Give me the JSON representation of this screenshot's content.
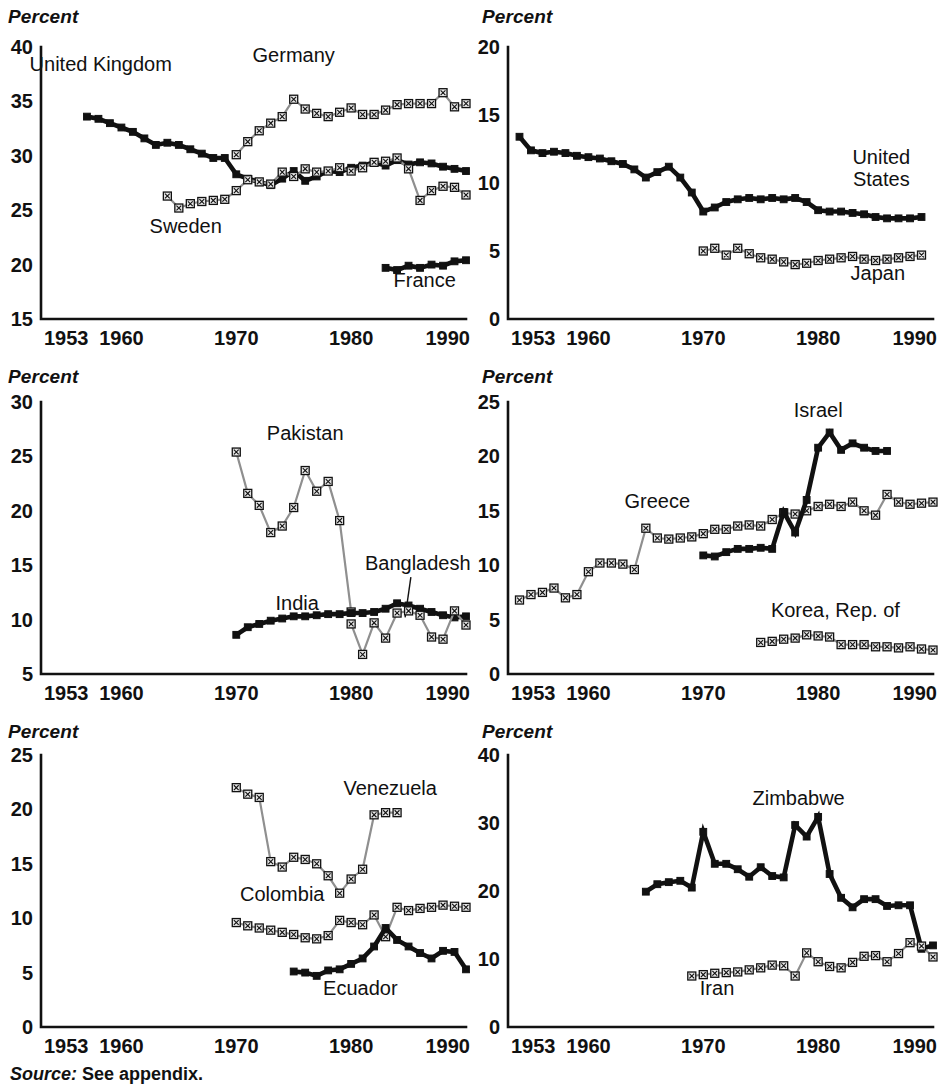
{
  "figure": {
    "source_label": "Source:",
    "source_text": "See appendix.",
    "axis_unit_label": "Percent"
  },
  "chart_data": [
    {
      "id": "panel-1",
      "type": "line",
      "title": "",
      "xlabel": "",
      "ylabel": "Percent",
      "xlim": [
        1953,
        1990
      ],
      "ylim": [
        15,
        40
      ],
      "xticks": [
        1953,
        1960,
        1970,
        1980,
        1990
      ],
      "yticks": [
        15,
        20,
        25,
        30,
        35,
        40
      ],
      "grid": false,
      "legend": "inline-annotations",
      "series": [
        {
          "name": "United Kingdom",
          "style": "dark-filled-square",
          "label_x": 1958.2,
          "label_y": 37.8,
          "x": [
            1957,
            1958,
            1959,
            1960,
            1961,
            1962,
            1963,
            1964,
            1965,
            1966,
            1967,
            1968,
            1969,
            1970,
            1971,
            1972,
            1973,
            1974,
            1975,
            1976,
            1977,
            1978,
            1979,
            1980,
            1981,
            1982,
            1983,
            1984,
            1985,
            1986,
            1987,
            1988,
            1989,
            1990
          ],
          "y": [
            33.6,
            33.4,
            33.0,
            32.6,
            32.2,
            31.6,
            31.0,
            31.2,
            31.0,
            30.6,
            30.2,
            29.8,
            29.8,
            28.3,
            27.9,
            27.6,
            27.3,
            27.9,
            28.6,
            27.7,
            28.1,
            28.6,
            28.5,
            28.9,
            29.1,
            29.4,
            29.1,
            29.6,
            29.2,
            29.4,
            29.3,
            29.0,
            28.8,
            28.6
          ]
        },
        {
          "name": "Germany",
          "style": "light-hatched-square",
          "label_x": 1975.0,
          "label_y": 38.6,
          "x": [
            1970,
            1971,
            1972,
            1973,
            1974,
            1975,
            1976,
            1977,
            1978,
            1979,
            1980,
            1981,
            1982,
            1983,
            1984,
            1985,
            1986,
            1987,
            1988,
            1989,
            1990
          ],
          "y": [
            30.1,
            31.3,
            32.3,
            33.0,
            33.6,
            35.2,
            34.3,
            33.9,
            33.6,
            34.0,
            34.4,
            33.8,
            33.8,
            34.2,
            34.7,
            34.8,
            34.8,
            34.8,
            35.8,
            34.5,
            34.8
          ]
        },
        {
          "name": "Sweden",
          "style": "light-hatched-square",
          "label_x": 1965.6,
          "label_y": 22.9,
          "x": [
            1964,
            1965,
            1966,
            1967,
            1968,
            1969,
            1970,
            1971,
            1972,
            1973,
            1974,
            1975,
            1976,
            1977,
            1978,
            1979,
            1980,
            1981,
            1982,
            1983,
            1984,
            1985,
            1986,
            1987,
            1988,
            1989,
            1990
          ],
          "y": [
            26.3,
            25.2,
            25.6,
            25.8,
            25.9,
            26.0,
            26.8,
            27.8,
            27.6,
            27.4,
            28.5,
            28.1,
            28.8,
            28.5,
            28.6,
            28.9,
            28.6,
            28.9,
            29.4,
            29.5,
            29.8,
            28.8,
            25.9,
            26.8,
            27.2,
            27.1,
            26.4
          ]
        },
        {
          "name": "France",
          "style": "dark-filled-square",
          "label_x": 1986.4,
          "label_y": 17.9,
          "x": [
            1983,
            1984,
            1985,
            1986,
            1987,
            1988,
            1989,
            1990
          ],
          "y": [
            19.7,
            19.5,
            19.9,
            19.7,
            20.0,
            19.9,
            20.3,
            20.4
          ]
        }
      ]
    },
    {
      "id": "panel-2",
      "type": "line",
      "title": "",
      "xlabel": "",
      "ylabel": "Percent",
      "xlim": [
        1953,
        1990
      ],
      "ylim": [
        0,
        20
      ],
      "xticks": [
        1953,
        1960,
        1970,
        1980,
        1990
      ],
      "yticks": [
        0,
        5,
        10,
        15,
        20
      ],
      "grid": false,
      "legend": "inline-annotations",
      "series": [
        {
          "name": "United States",
          "style": "dark-filled-square",
          "label_x": 1985.5,
          "label_y": 11.4,
          "label_lines": [
            "United",
            "States"
          ],
          "x": [
            1954,
            1955,
            1956,
            1957,
            1958,
            1959,
            1960,
            1961,
            1962,
            1963,
            1964,
            1965,
            1966,
            1967,
            1968,
            1969,
            1970,
            1971,
            1972,
            1973,
            1974,
            1975,
            1976,
            1977,
            1978,
            1979,
            1980,
            1981,
            1982,
            1983,
            1984,
            1985,
            1986,
            1987,
            1988,
            1989
          ],
          "y": [
            13.4,
            12.4,
            12.2,
            12.3,
            12.2,
            12.0,
            11.9,
            11.8,
            11.6,
            11.4,
            11.0,
            10.4,
            10.8,
            11.2,
            10.4,
            9.3,
            7.9,
            8.2,
            8.6,
            8.8,
            8.9,
            8.8,
            8.9,
            8.8,
            8.9,
            8.6,
            8.0,
            7.9,
            7.9,
            7.8,
            7.7,
            7.5,
            7.4,
            7.4,
            7.4,
            7.5
          ]
        },
        {
          "name": "Japan",
          "style": "light-hatched-square",
          "label_x": 1985.2,
          "label_y": 2.9,
          "x": [
            1970,
            1971,
            1972,
            1973,
            1974,
            1975,
            1976,
            1977,
            1978,
            1979,
            1980,
            1981,
            1982,
            1983,
            1984,
            1985,
            1986,
            1987,
            1988,
            1989
          ],
          "y": [
            5.0,
            5.2,
            4.7,
            5.2,
            4.8,
            4.5,
            4.4,
            4.2,
            4.0,
            4.1,
            4.3,
            4.4,
            4.5,
            4.6,
            4.4,
            4.3,
            4.4,
            4.5,
            4.6,
            4.7
          ]
        }
      ]
    },
    {
      "id": "panel-3",
      "type": "line",
      "title": "",
      "xlabel": "",
      "ylabel": "Percent",
      "xlim": [
        1953,
        1990
      ],
      "ylim": [
        5,
        30
      ],
      "xticks": [
        1953,
        1960,
        1970,
        1980,
        1990
      ],
      "yticks": [
        5,
        10,
        15,
        20,
        25,
        30
      ],
      "grid": false,
      "legend": "inline-annotations",
      "series": [
        {
          "name": "Pakistan",
          "style": "light-hatched-square",
          "label_x": 1976.0,
          "label_y": 26.5,
          "x": [
            1970,
            1971,
            1972,
            1973,
            1974,
            1975,
            1976,
            1977,
            1978,
            1979,
            1980
          ],
          "y": [
            25.4,
            21.6,
            20.5,
            18.0,
            18.6,
            20.3,
            23.7,
            21.8,
            22.7,
            19.1,
            10.7
          ]
        },
        {
          "name": "India",
          "style": "dark-filled-square",
          "label_x": 1975.3,
          "label_y": 10.9,
          "x": [
            1970,
            1971,
            1972,
            1973,
            1974,
            1975,
            1976,
            1977,
            1978,
            1979,
            1980,
            1981,
            1982,
            1983,
            1984,
            1985,
            1986,
            1987,
            1988,
            1989,
            1990
          ],
          "y": [
            8.6,
            9.3,
            9.6,
            9.9,
            10.1,
            10.3,
            10.3,
            10.4,
            10.5,
            10.5,
            10.6,
            10.6,
            10.7,
            11.0,
            11.5,
            11.3,
            11.0,
            10.7,
            10.4,
            10.2,
            10.3
          ]
        },
        {
          "name": "Bangladesh",
          "style": "light-hatched-square",
          "label_x": 1985.8,
          "label_y": 14.6,
          "leader": {
            "x1": 1985.2,
            "y1": 13.9,
            "x2": 1984.7,
            "y2": 10.2
          },
          "x": [
            1980,
            1981,
            1982,
            1983,
            1984,
            1985,
            1986,
            1987,
            1988,
            1989,
            1990
          ],
          "y": [
            9.6,
            6.8,
            9.7,
            8.3,
            10.6,
            10.8,
            10.4,
            8.4,
            8.2,
            10.8,
            9.5
          ]
        }
      ]
    },
    {
      "id": "panel-4",
      "type": "line",
      "title": "",
      "xlabel": "",
      "ylabel": "Percent",
      "xlim": [
        1953,
        1990
      ],
      "ylim": [
        0,
        25
      ],
      "xticks": [
        1953,
        1960,
        1970,
        1980,
        1990
      ],
      "yticks": [
        0,
        5,
        10,
        15,
        20,
        25
      ],
      "grid": false,
      "legend": "inline-annotations",
      "series": [
        {
          "name": "Greece",
          "style": "light-hatched-square",
          "label_x": 1966.0,
          "label_y": 15.3,
          "x": [
            1954,
            1955,
            1956,
            1957,
            1958,
            1959,
            1960,
            1961,
            1962,
            1963,
            1964,
            1965,
            1966,
            1967,
            1968,
            1969,
            1970,
            1971,
            1972,
            1973,
            1974,
            1975,
            1976,
            1977,
            1978,
            1979,
            1980,
            1981,
            1982,
            1983,
            1984,
            1985,
            1986,
            1987,
            1988,
            1989,
            1990
          ],
          "y": [
            6.8,
            7.3,
            7.5,
            7.9,
            7.0,
            7.3,
            9.4,
            10.2,
            10.2,
            10.1,
            9.6,
            13.4,
            12.5,
            12.4,
            12.5,
            12.6,
            12.9,
            13.3,
            13.3,
            13.6,
            13.7,
            13.6,
            14.2,
            14.8,
            14.7,
            15.0,
            15.4,
            15.6,
            15.4,
            15.8,
            15.0,
            14.6,
            16.5,
            15.8,
            15.6,
            15.7,
            15.8
          ]
        },
        {
          "name": "Israel",
          "style": "dark-filled-square",
          "label_x": 1980.0,
          "label_y": 23.6,
          "x": [
            1970,
            1971,
            1972,
            1973,
            1974,
            1975,
            1976,
            1977,
            1978,
            1979,
            1980,
            1981,
            1982,
            1983,
            1984,
            1985,
            1986
          ],
          "y": [
            10.9,
            10.8,
            11.2,
            11.5,
            11.5,
            11.6,
            11.5,
            14.9,
            13.0,
            16.0,
            20.8,
            22.2,
            20.6,
            21.2,
            20.8,
            20.5,
            20.5
          ]
        },
        {
          "name": "Korea, Rep. of",
          "style": "light-hatched-square",
          "label_x": 1981.5,
          "label_y": 5.2,
          "x": [
            1975,
            1976,
            1977,
            1978,
            1979,
            1980,
            1981,
            1982,
            1983,
            1984,
            1985,
            1986,
            1987,
            1988,
            1989,
            1990
          ],
          "y": [
            2.9,
            3.0,
            3.2,
            3.3,
            3.6,
            3.5,
            3.4,
            2.7,
            2.7,
            2.7,
            2.5,
            2.5,
            2.4,
            2.5,
            2.3,
            2.2
          ]
        }
      ]
    },
    {
      "id": "panel-5",
      "type": "line",
      "title": "",
      "xlabel": "",
      "ylabel": "Percent",
      "xlim": [
        1953,
        1990
      ],
      "ylim": [
        0,
        25
      ],
      "xticks": [
        1953,
        1960,
        1970,
        1980,
        1990
      ],
      "yticks": [
        0,
        5,
        10,
        15,
        20,
        25
      ],
      "grid": false,
      "legend": "inline-annotations",
      "series": [
        {
          "name": "Venezuela",
          "style": "light-hatched-square",
          "label_x": 1983.4,
          "label_y": 21.3,
          "x": [
            1970,
            1971,
            1972,
            1973,
            1974,
            1975,
            1976,
            1977,
            1978,
            1979,
            1980,
            1981,
            1982,
            1983,
            1984
          ],
          "y": [
            22.0,
            21.4,
            21.1,
            15.2,
            14.7,
            15.6,
            15.4,
            15.0,
            13.9,
            12.3,
            13.6,
            14.5,
            19.5,
            19.7,
            19.7
          ]
        },
        {
          "name": "Colombia",
          "style": "light-hatched-square",
          "label_x": 1974.0,
          "label_y": 11.6,
          "x": [
            1970,
            1971,
            1972,
            1973,
            1974,
            1975,
            1976,
            1977,
            1978,
            1979,
            1980,
            1981,
            1982,
            1983,
            1984,
            1985,
            1986,
            1987,
            1988,
            1989,
            1990
          ],
          "y": [
            9.6,
            9.3,
            9.1,
            8.9,
            8.7,
            8.5,
            8.2,
            8.1,
            8.4,
            9.8,
            9.6,
            9.4,
            10.3,
            8.3,
            11.0,
            10.7,
            10.9,
            11.0,
            11.2,
            11.1,
            11.0
          ]
        },
        {
          "name": "Ecuador",
          "style": "dark-filled-square",
          "label_x": 1980.8,
          "label_y": 2.9,
          "x": [
            1975,
            1976,
            1977,
            1978,
            1979,
            1980,
            1981,
            1982,
            1983,
            1984,
            1985,
            1986,
            1987,
            1988,
            1989,
            1990
          ],
          "y": [
            5.1,
            5.0,
            4.7,
            5.2,
            5.3,
            5.8,
            6.3,
            7.4,
            9.1,
            8.0,
            7.4,
            6.8,
            6.3,
            7.0,
            6.9,
            5.3
          ]
        }
      ]
    },
    {
      "id": "panel-6",
      "type": "line",
      "title": "",
      "xlabel": "",
      "ylabel": "Percent",
      "xlim": [
        1953,
        1990
      ],
      "ylim": [
        0,
        40
      ],
      "xticks": [
        1953,
        1960,
        1970,
        1980,
        1990
      ],
      "yticks": [
        0,
        10,
        20,
        30,
        40
      ],
      "grid": false,
      "legend": "inline-annotations",
      "series": [
        {
          "name": "Zimbabwe",
          "style": "dark-filled-square",
          "label_x": 1978.3,
          "label_y": 32.6,
          "x": [
            1965,
            1966,
            1967,
            1968,
            1969,
            1970,
            1971,
            1972,
            1973,
            1974,
            1975,
            1976,
            1977,
            1978,
            1979,
            1980,
            1981,
            1982,
            1983,
            1984,
            1985,
            1986,
            1987,
            1988,
            1989,
            1990
          ],
          "y": [
            19.9,
            21.0,
            21.3,
            21.5,
            20.5,
            28.7,
            24.0,
            24.0,
            23.2,
            22.1,
            23.5,
            22.2,
            22.0,
            29.7,
            28.0,
            30.9,
            22.5,
            19.0,
            17.6,
            18.8,
            18.8,
            17.8,
            17.9,
            17.9,
            11.5,
            12.0
          ]
        },
        {
          "name": "Iran",
          "style": "light-hatched-square",
          "label_x": 1971.2,
          "label_y": 4.7,
          "x": [
            1969,
            1970,
            1971,
            1972,
            1973,
            1974,
            1975,
            1976,
            1977,
            1978,
            1979,
            1980,
            1981,
            1982,
            1983,
            1984,
            1985,
            1986,
            1987,
            1988,
            1989,
            1990
          ],
          "y": [
            7.5,
            7.7,
            7.9,
            8.0,
            8.1,
            8.4,
            8.7,
            9.1,
            9.0,
            7.5,
            10.9,
            9.6,
            8.9,
            8.7,
            9.5,
            10.4,
            10.5,
            9.6,
            10.8,
            12.4,
            11.9,
            10.3
          ]
        }
      ]
    }
  ]
}
